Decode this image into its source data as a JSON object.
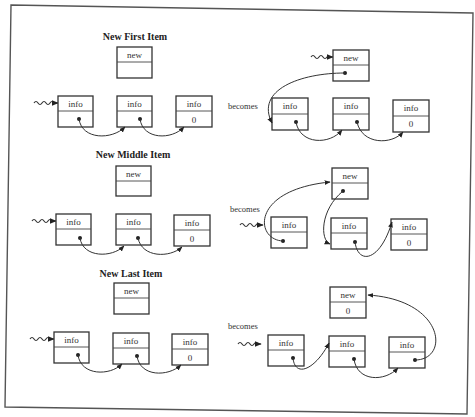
{
  "diagram": {
    "frame": {
      "border_color": "#555555",
      "background": "#ffffff"
    },
    "becomes_label": "becomes",
    "sections": [
      {
        "id": "first",
        "title": "New First Item",
        "before": {
          "new_node": {
            "top": "new",
            "bottom": ""
          },
          "list": [
            {
              "top": "info",
              "bottom": "•"
            },
            {
              "top": "info",
              "bottom": "•"
            },
            {
              "top": "info",
              "bottom": "0"
            }
          ]
        },
        "after": {
          "new_node": {
            "top": "new",
            "bottom": "•"
          },
          "list": [
            {
              "top": "info",
              "bottom": "•"
            },
            {
              "top": "info",
              "bottom": "•"
            },
            {
              "top": "info",
              "bottom": "0"
            }
          ]
        }
      },
      {
        "id": "middle",
        "title": "New Middle Item",
        "before": {
          "new_node": {
            "top": "new",
            "bottom": ""
          },
          "list": [
            {
              "top": "info",
              "bottom": "•"
            },
            {
              "top": "info",
              "bottom": "•"
            },
            {
              "top": "info",
              "bottom": "0"
            }
          ]
        },
        "after": {
          "new_node": {
            "top": "new",
            "bottom": "•"
          },
          "list": [
            {
              "top": "info",
              "bottom": "•"
            },
            {
              "top": "info",
              "bottom": "•"
            },
            {
              "top": "info",
              "bottom": "0"
            }
          ]
        }
      },
      {
        "id": "last",
        "title": "New Last Item",
        "before": {
          "new_node": {
            "top": "new",
            "bottom": ""
          },
          "list": [
            {
              "top": "info",
              "bottom": "•"
            },
            {
              "top": "info",
              "bottom": "•"
            },
            {
              "top": "info",
              "bottom": "0"
            }
          ]
        },
        "after": {
          "new_node": {
            "top": "new",
            "bottom": "0"
          },
          "list": [
            {
              "top": "info",
              "bottom": "•"
            },
            {
              "top": "info",
              "bottom": "•"
            },
            {
              "top": "info",
              "bottom": "•"
            }
          ]
        }
      }
    ]
  }
}
